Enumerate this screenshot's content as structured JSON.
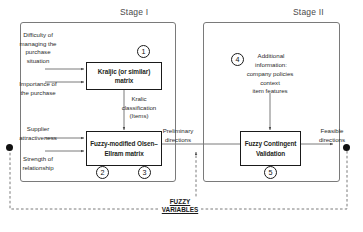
{
  "diagram": {
    "stages": [
      {
        "id": "stage-1",
        "label": "Stage I"
      },
      {
        "id": "stage-2",
        "label": "Stage II"
      }
    ],
    "inputs": {
      "difficulty": "Difficulty of\nmanaging the\npurchase\nsituation",
      "importance": "Importance of\nthe purchase",
      "supplier_attractiveness": "Supplier\nattractiveness",
      "strength_relationship": "Strength of\nrelationship"
    },
    "process_boxes": [
      {
        "id": "kraljic-matrix",
        "label": "Kraljic (or similar)\nmatrix",
        "number": "1"
      },
      {
        "id": "olsen-ellram-matrix",
        "label": "Fuzzy-modified\nOlsen–Ellram\nmatrix",
        "numbers": [
          "2",
          "3"
        ]
      },
      {
        "id": "fuzzy-contingent-validation",
        "label": "Fuzzy\nContingent\nValidation",
        "number": "5"
      }
    ],
    "flow_labels": {
      "kraljic_classification": "Kralic\nclassification\n(Items)",
      "preliminary_directions": "Preliminary\ndirections",
      "feasible_directions": "Feasible\ndirections"
    },
    "additional_information": {
      "number": "4",
      "heading": "Additional\ninformation:",
      "items": "company policies\ncontext\nitem features"
    },
    "feedback_label": "FUZZY\nVARIABLES",
    "colors": {
      "stage_border": "#7a7a7a",
      "box_border": "#1a1a1a",
      "text": "#231f20",
      "connector": "#111111",
      "arrow": "#555555"
    }
  }
}
